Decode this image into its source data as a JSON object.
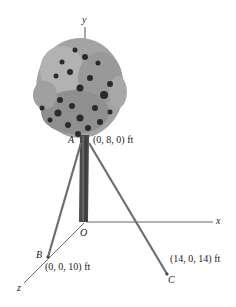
{
  "diagram": {
    "type": "3d-statics-figure",
    "axes": {
      "x_label": "x",
      "y_label": "y",
      "z_label": "z",
      "origin_label": "O"
    },
    "points": [
      {
        "name": "A",
        "coords": "(0, 8, 0) ft"
      },
      {
        "name": "B",
        "coords": "(0, 0, 10) ft"
      },
      {
        "name": "C",
        "coords": "(14, 0, 14) ft"
      }
    ],
    "objects": [
      "tree",
      "cable-AB",
      "cable-AC"
    ],
    "colors": {
      "foliage_light": "#9a9a9a",
      "foliage_dark": "#2a2a2a",
      "cable": "#6e6e6e",
      "axis": "#555555"
    }
  }
}
